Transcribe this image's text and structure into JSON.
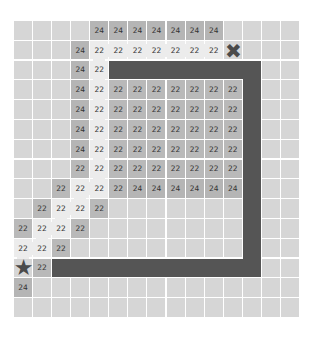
{
  "board": {
    "rows": 15,
    "cols": 15,
    "cell_w": 19.07,
    "cell_h": 19.8,
    "colors": {
      "empty": "#d6d6d6",
      "value_cell": "#b7b7b7",
      "path": "#ececec",
      "wall": "#555555",
      "marker": "#4a4a4a"
    },
    "cells": [
      {
        "r": 0,
        "c": 4,
        "v": "24",
        "t": "c24"
      },
      {
        "r": 0,
        "c": 5,
        "v": "24",
        "t": "c24"
      },
      {
        "r": 0,
        "c": 6,
        "v": "24",
        "t": "c24"
      },
      {
        "r": 0,
        "c": 7,
        "v": "24",
        "t": "c24"
      },
      {
        "r": 0,
        "c": 8,
        "v": "24",
        "t": "c24"
      },
      {
        "r": 0,
        "c": 9,
        "v": "24",
        "t": "c24"
      },
      {
        "r": 0,
        "c": 10,
        "v": "24",
        "t": "c24"
      },
      {
        "r": 1,
        "c": 3,
        "v": "24",
        "t": "c24"
      },
      {
        "r": 1,
        "c": 4,
        "v": "22",
        "t": "path"
      },
      {
        "r": 1,
        "c": 5,
        "v": "22",
        "t": "path"
      },
      {
        "r": 1,
        "c": 6,
        "v": "22",
        "t": "path"
      },
      {
        "r": 1,
        "c": 7,
        "v": "22",
        "t": "path"
      },
      {
        "r": 1,
        "c": 8,
        "v": "22",
        "t": "path"
      },
      {
        "r": 1,
        "c": 9,
        "v": "22",
        "t": "path"
      },
      {
        "r": 1,
        "c": 10,
        "v": "22",
        "t": "path"
      },
      {
        "r": 2,
        "c": 3,
        "v": "24",
        "t": "c24"
      },
      {
        "r": 2,
        "c": 4,
        "v": "22",
        "t": "path"
      },
      {
        "r": 3,
        "c": 3,
        "v": "24",
        "t": "c24"
      },
      {
        "r": 3,
        "c": 4,
        "v": "22",
        "t": "path"
      },
      {
        "r": 3,
        "c": 5,
        "v": "22",
        "t": "c22"
      },
      {
        "r": 3,
        "c": 6,
        "v": "22",
        "t": "c22"
      },
      {
        "r": 3,
        "c": 7,
        "v": "22",
        "t": "c22"
      },
      {
        "r": 3,
        "c": 8,
        "v": "22",
        "t": "c22"
      },
      {
        "r": 3,
        "c": 9,
        "v": "22",
        "t": "c22"
      },
      {
        "r": 3,
        "c": 10,
        "v": "22",
        "t": "c22"
      },
      {
        "r": 3,
        "c": 11,
        "v": "22",
        "t": "c22"
      },
      {
        "r": 4,
        "c": 3,
        "v": "24",
        "t": "c24"
      },
      {
        "r": 4,
        "c": 4,
        "v": "22",
        "t": "path"
      },
      {
        "r": 4,
        "c": 5,
        "v": "22",
        "t": "c22"
      },
      {
        "r": 4,
        "c": 6,
        "v": "22",
        "t": "c22"
      },
      {
        "r": 4,
        "c": 7,
        "v": "22",
        "t": "c22"
      },
      {
        "r": 4,
        "c": 8,
        "v": "22",
        "t": "c22"
      },
      {
        "r": 4,
        "c": 9,
        "v": "22",
        "t": "c22"
      },
      {
        "r": 4,
        "c": 10,
        "v": "22",
        "t": "c22"
      },
      {
        "r": 4,
        "c": 11,
        "v": "22",
        "t": "c22"
      },
      {
        "r": 5,
        "c": 3,
        "v": "24",
        "t": "c24"
      },
      {
        "r": 5,
        "c": 4,
        "v": "22",
        "t": "path"
      },
      {
        "r": 5,
        "c": 5,
        "v": "22",
        "t": "c22"
      },
      {
        "r": 5,
        "c": 6,
        "v": "22",
        "t": "c22"
      },
      {
        "r": 5,
        "c": 7,
        "v": "22",
        "t": "c22"
      },
      {
        "r": 5,
        "c": 8,
        "v": "22",
        "t": "c22"
      },
      {
        "r": 5,
        "c": 9,
        "v": "22",
        "t": "c22"
      },
      {
        "r": 5,
        "c": 10,
        "v": "22",
        "t": "c22"
      },
      {
        "r": 5,
        "c": 11,
        "v": "22",
        "t": "c22"
      },
      {
        "r": 6,
        "c": 3,
        "v": "24",
        "t": "c24"
      },
      {
        "r": 6,
        "c": 4,
        "v": "22",
        "t": "path"
      },
      {
        "r": 6,
        "c": 5,
        "v": "22",
        "t": "c22"
      },
      {
        "r": 6,
        "c": 6,
        "v": "22",
        "t": "c22"
      },
      {
        "r": 6,
        "c": 7,
        "v": "22",
        "t": "c22"
      },
      {
        "r": 6,
        "c": 8,
        "v": "22",
        "t": "c22"
      },
      {
        "r": 6,
        "c": 9,
        "v": "22",
        "t": "c22"
      },
      {
        "r": 6,
        "c": 10,
        "v": "22",
        "t": "c22"
      },
      {
        "r": 6,
        "c": 11,
        "v": "22",
        "t": "c22"
      },
      {
        "r": 7,
        "c": 3,
        "v": "22",
        "t": "c22"
      },
      {
        "r": 7,
        "c": 4,
        "v": "22",
        "t": "path"
      },
      {
        "r": 7,
        "c": 5,
        "v": "22",
        "t": "c22"
      },
      {
        "r": 7,
        "c": 6,
        "v": "22",
        "t": "c22"
      },
      {
        "r": 7,
        "c": 7,
        "v": "22",
        "t": "c22"
      },
      {
        "r": 7,
        "c": 8,
        "v": "22",
        "t": "c22"
      },
      {
        "r": 7,
        "c": 9,
        "v": "22",
        "t": "c22"
      },
      {
        "r": 7,
        "c": 10,
        "v": "22",
        "t": "c22"
      },
      {
        "r": 7,
        "c": 11,
        "v": "22",
        "t": "c22"
      },
      {
        "r": 8,
        "c": 2,
        "v": "22",
        "t": "c22"
      },
      {
        "r": 8,
        "c": 3,
        "v": "22",
        "t": "path"
      },
      {
        "r": 8,
        "c": 4,
        "v": "22",
        "t": "path"
      },
      {
        "r": 8,
        "c": 5,
        "v": "22",
        "t": "c22"
      },
      {
        "r": 8,
        "c": 6,
        "v": "24",
        "t": "c24"
      },
      {
        "r": 8,
        "c": 7,
        "v": "24",
        "t": "c24"
      },
      {
        "r": 8,
        "c": 8,
        "v": "24",
        "t": "c24"
      },
      {
        "r": 8,
        "c": 9,
        "v": "24",
        "t": "c24"
      },
      {
        "r": 8,
        "c": 10,
        "v": "24",
        "t": "c24"
      },
      {
        "r": 8,
        "c": 11,
        "v": "24",
        "t": "c24"
      },
      {
        "r": 9,
        "c": 1,
        "v": "22",
        "t": "c22"
      },
      {
        "r": 9,
        "c": 2,
        "v": "22",
        "t": "path"
      },
      {
        "r": 9,
        "c": 3,
        "v": "22",
        "t": "path"
      },
      {
        "r": 9,
        "c": 4,
        "v": "22",
        "t": "c22"
      },
      {
        "r": 10,
        "c": 0,
        "v": "22",
        "t": "c22"
      },
      {
        "r": 10,
        "c": 1,
        "v": "22",
        "t": "path"
      },
      {
        "r": 10,
        "c": 2,
        "v": "22",
        "t": "path"
      },
      {
        "r": 10,
        "c": 3,
        "v": "22",
        "t": "c22"
      },
      {
        "r": 11,
        "c": 0,
        "v": "22",
        "t": "path"
      },
      {
        "r": 11,
        "c": 1,
        "v": "22",
        "t": "path"
      },
      {
        "r": 11,
        "c": 2,
        "v": "22",
        "t": "c22"
      },
      {
        "r": 12,
        "c": 1,
        "v": "22",
        "t": "c22"
      },
      {
        "r": 13,
        "c": 0,
        "v": "24",
        "t": "c24"
      }
    ],
    "connectors": [
      {
        "r": 1,
        "c": 4,
        "dir": "h",
        "len": 6
      },
      {
        "r": 1,
        "c": 4,
        "dir": "v",
        "len": 7
      },
      {
        "r": 8,
        "c": 3,
        "dir": "h",
        "len": 1
      },
      {
        "r": 8,
        "c": 3,
        "dir": "v",
        "len": 1
      },
      {
        "r": 9,
        "c": 2,
        "dir": "h",
        "len": 1
      },
      {
        "r": 9,
        "c": 2,
        "dir": "v",
        "len": 1
      },
      {
        "r": 10,
        "c": 1,
        "dir": "h",
        "len": 1
      },
      {
        "r": 10,
        "c": 1,
        "dir": "v",
        "len": 1
      },
      {
        "r": 11,
        "c": 0,
        "dir": "h",
        "len": 1
      },
      {
        "r": 11,
        "c": 0,
        "dir": "v",
        "len": 1
      }
    ],
    "walls": [
      {
        "r0": 2,
        "c0": 5,
        "r1": 2,
        "c1": 12
      },
      {
        "r0": 2,
        "c0": 12,
        "r1": 12,
        "c1": 12
      },
      {
        "r0": 12,
        "c0": 2,
        "r1": 12,
        "c1": 12
      }
    ],
    "markers": {
      "goal": {
        "r": 1,
        "c": 11,
        "icon": "x-mark-icon",
        "glyph": "✖"
      },
      "start": {
        "r": 12,
        "c": 0,
        "icon": "star-icon",
        "glyph": "★"
      }
    }
  }
}
